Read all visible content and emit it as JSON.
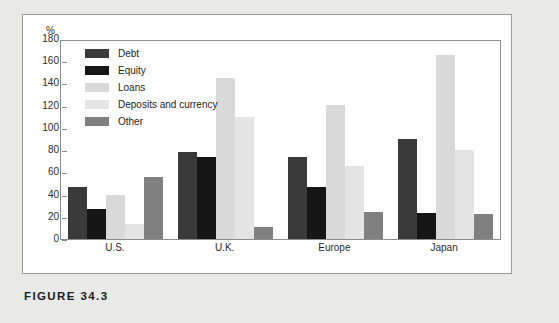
{
  "caption": "FIGURE 34.3",
  "y_unit_label": "%",
  "colors": {
    "debt": "#3a3a3a",
    "equity": "#161616",
    "loans": "#d9d9d9",
    "deposits": "#e4e4e4",
    "other": "#808080",
    "panel_background": "#ffffff",
    "page_background": "#e9e9e7",
    "axis": "#8c8c8c",
    "text": "#2b2b2b"
  },
  "chart_data": {
    "type": "bar",
    "title": "",
    "xlabel": "",
    "ylabel": "%",
    "ylim": [
      0,
      180
    ],
    "yticks": [
      0,
      20,
      40,
      60,
      80,
      100,
      120,
      140,
      160,
      180
    ],
    "ytick_labels": [
      "0",
      "20",
      "40",
      "60",
      "80",
      "100",
      "120",
      "140",
      "160",
      "180"
    ],
    "grid": false,
    "legend_position": "upper-left",
    "categories": [
      "U.S.",
      "U.K.",
      "Europe",
      "Japan"
    ],
    "series": [
      {
        "name": "Debt",
        "color": "#3a3a3a",
        "values": [
          47,
          79,
          75,
          91
        ]
      },
      {
        "name": "Equity",
        "color": "#161616",
        "values": [
          27,
          75,
          47,
          24
        ]
      },
      {
        "name": "Loans",
        "color": "#d9d9d9",
        "values": [
          40,
          146,
          122,
          167
        ]
      },
      {
        "name": "Deposits and currency",
        "color": "#e4e4e4",
        "values": [
          14,
          111,
          66,
          81
        ]
      },
      {
        "name": "Other",
        "color": "#808080",
        "values": [
          56,
          11,
          25,
          23
        ]
      }
    ]
  }
}
